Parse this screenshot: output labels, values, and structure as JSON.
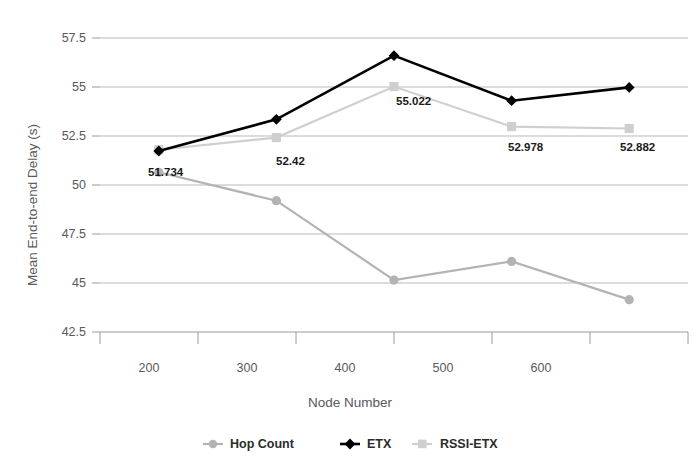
{
  "chart_data": {
    "type": "line",
    "title": "",
    "xlabel": "Node Number",
    "ylabel": "Mean End-to-end Delay (s)",
    "categories": [
      "200",
      "300",
      "400",
      "500",
      "600"
    ],
    "x": [
      200,
      300,
      400,
      500,
      600
    ],
    "ylim": [
      42.5,
      57.5
    ],
    "ytick_labels": [
      "57.5",
      "55",
      "52.5",
      "50",
      "47.5",
      "45",
      "42.5"
    ],
    "ytick_values": [
      57.5,
      55,
      52.5,
      50,
      47.5,
      45,
      42.5
    ],
    "grid": true,
    "legend_position": "bottom",
    "series": [
      {
        "name": "Hop Count",
        "color": "#b3b3b3",
        "marker": "circle",
        "values": [
          50.65,
          49.2,
          45.15,
          46.1,
          44.15
        ],
        "labels": [
          "",
          "",
          "",
          "",
          ""
        ]
      },
      {
        "name": "ETX",
        "color": "#000000",
        "marker": "diamond",
        "values": [
          51.734,
          53.35,
          56.6,
          54.3,
          54.98
        ],
        "labels": [
          "51.734",
          "",
          "",
          "",
          ""
        ]
      },
      {
        "name": "RSSI-ETX",
        "color": "#cfcfcf",
        "marker": "square",
        "values": [
          51.8,
          52.42,
          55.022,
          52.978,
          52.882
        ],
        "labels": [
          "",
          "52.42",
          "55.022",
          "52.978",
          "52.882"
        ]
      }
    ],
    "annotations": [
      {
        "text": "51.734",
        "x": 148,
        "y": 176
      },
      {
        "text": "52.42",
        "x": 276,
        "y": 165
      },
      {
        "text": "55.022",
        "x": 396,
        "y": 105
      },
      {
        "text": "52.978",
        "x": 508,
        "y": 151
      },
      {
        "text": "52.882",
        "x": 620,
        "y": 151
      }
    ]
  },
  "axis": {
    "x_tick_labels": [
      "200",
      "300",
      "400",
      "500",
      "600"
    ],
    "y_tick_labels": [
      "57.5",
      "55",
      "52.5",
      "50",
      "47.5",
      "45",
      "42.5"
    ],
    "x_title": "Node Number",
    "y_title": "Mean End-to-end Delay (s)"
  },
  "legend": {
    "items": [
      {
        "label": "Hop Count",
        "marker": "circle-marker",
        "color": "#b3b3b3"
      },
      {
        "label": "ETX",
        "marker": "diamond-marker",
        "color": "#000000"
      },
      {
        "label": "RSSI-ETX",
        "marker": "square-marker",
        "color": "#cfcfcf"
      }
    ]
  }
}
